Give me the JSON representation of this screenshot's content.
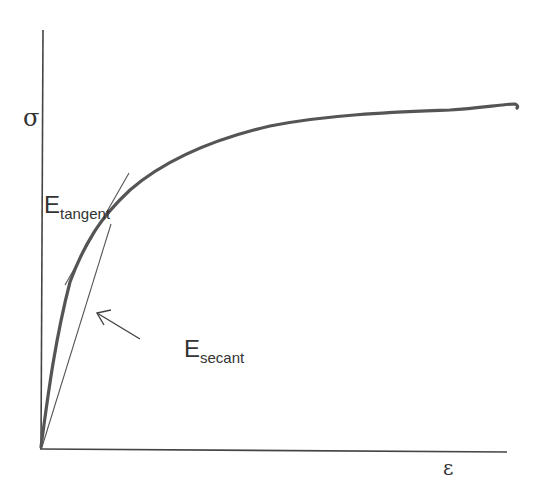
{
  "axes": {
    "y_label": "σ",
    "x_label": "ε"
  },
  "annotations": {
    "tangent": {
      "main": "E",
      "sub": "tangent"
    },
    "secant": {
      "main": "E",
      "sub": "secant"
    }
  },
  "colors": {
    "curve": "#555555",
    "axes": "#444444",
    "lines": "#555555",
    "text": "#333333"
  }
}
